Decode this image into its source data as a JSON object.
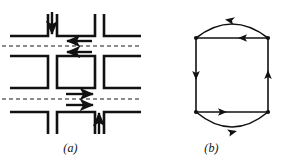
{
  "figure": {
    "background": "#ffffff",
    "ink": "#111111",
    "dash_color": "#555555",
    "width": 282,
    "height": 160
  },
  "panels": [
    {
      "id": "a",
      "caption": "(a)",
      "description": "street grid with one-way traffic arrows and dashed road center lines",
      "blocks": [
        {
          "name": "block-top-left",
          "x": 10,
          "y": 14,
          "w": 38,
          "h": 22
        },
        {
          "name": "block-top-center",
          "x": 57,
          "y": 14,
          "w": 38,
          "h": 22
        },
        {
          "name": "block-top-right",
          "x": 104,
          "y": 14,
          "w": 36,
          "h": 22
        },
        {
          "name": "block-middle-left",
          "x": 10,
          "y": 56,
          "w": 38,
          "h": 32
        },
        {
          "name": "block-middle-center",
          "x": 57,
          "y": 56,
          "w": 38,
          "h": 32
        },
        {
          "name": "block-middle-right",
          "x": 104,
          "y": 56,
          "w": 36,
          "h": 32
        },
        {
          "name": "block-bottom-left",
          "x": 10,
          "y": 112,
          "w": 38,
          "h": 22
        },
        {
          "name": "block-bottom-center",
          "x": 57,
          "y": 112,
          "w": 38,
          "h": 22
        },
        {
          "name": "block-bottom-right",
          "x": 104,
          "y": 112,
          "w": 36,
          "h": 22
        }
      ],
      "dashed_lines": [
        {
          "name": "center-line-upper",
          "y": 46
        },
        {
          "name": "center-line-lower",
          "y": 99
        }
      ],
      "arrows": [
        {
          "name": "arrow-down-vertical-street",
          "direction": "down",
          "x1": 52,
          "y1": 12,
          "x2": 52,
          "y2": 33
        },
        {
          "name": "arrow-left-upper-street-1",
          "direction": "left",
          "x1": 91,
          "y1": 41,
          "x2": 67,
          "y2": 41
        },
        {
          "name": "arrow-left-upper-street-2",
          "direction": "left",
          "x1": 91,
          "y1": 52,
          "x2": 67,
          "y2": 52
        },
        {
          "name": "arrow-right-lower-street-1",
          "direction": "right",
          "x1": 67,
          "y1": 94,
          "x2": 93,
          "y2": 94
        },
        {
          "name": "arrow-right-lower-street-2",
          "direction": "right",
          "x1": 67,
          "y1": 105,
          "x2": 93,
          "y2": 105
        },
        {
          "name": "arrow-up-vertical-street",
          "direction": "up",
          "x1": 99,
          "y1": 133,
          "x2": 99,
          "y2": 114
        }
      ]
    },
    {
      "id": "b",
      "caption": "(b)",
      "description": "directed multigraph: four vertices, four straight edges forming a rectangle plus two curved parallel edges",
      "vertices": [
        {
          "name": "vertex-top-left",
          "cx": 55,
          "cy": 38
        },
        {
          "name": "vertex-top-right",
          "cx": 127,
          "cy": 38
        },
        {
          "name": "vertex-bottom-left",
          "cx": 55,
          "cy": 112
        },
        {
          "name": "vertex-bottom-right",
          "cx": 127,
          "cy": 112
        }
      ],
      "edges": [
        {
          "name": "edge-top-straight",
          "from": "vertex-top-right",
          "to": "vertex-top-left",
          "shape": "straight",
          "direction": "left"
        },
        {
          "name": "edge-top-curved",
          "from": "vertex-top-right",
          "to": "vertex-top-left",
          "shape": "curve-up",
          "direction": "left"
        },
        {
          "name": "edge-left-straight",
          "from": "vertex-top-left",
          "to": "vertex-bottom-left",
          "shape": "straight",
          "direction": "down"
        },
        {
          "name": "edge-right-straight",
          "from": "vertex-bottom-right",
          "to": "vertex-top-right",
          "shape": "straight",
          "direction": "up"
        },
        {
          "name": "edge-bottom-straight",
          "from": "vertex-bottom-left",
          "to": "vertex-bottom-right",
          "shape": "straight",
          "direction": "right"
        },
        {
          "name": "edge-bottom-curved",
          "from": "vertex-bottom-left",
          "to": "vertex-bottom-right",
          "shape": "curve-down",
          "direction": "right"
        }
      ]
    }
  ]
}
